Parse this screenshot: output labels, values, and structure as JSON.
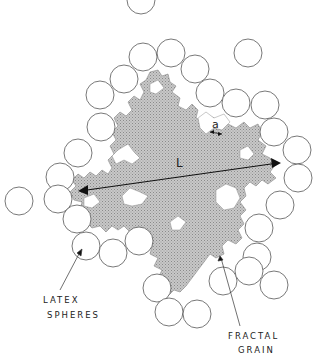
{
  "figure": {
    "labels": {
      "latex_spheres_line1": "LATEX",
      "latex_spheres_line2": "SPHERES",
      "fractal_grain_line1": "FRACTAL",
      "fractal_grain_line2": "GRAIN",
      "length_symbol": "L",
      "radius_symbol": "a"
    },
    "colors": {
      "grain_fill": "#bdbdbd",
      "sphere_stroke": "#555555",
      "background": "#ffffff",
      "ink": "#222222"
    },
    "sphere_radius_px": 14,
    "spheres": [
      {
        "cx": 141,
        "cy": 0
      },
      {
        "cx": 248,
        "cy": 53
      },
      {
        "cx": 143,
        "cy": 57
      },
      {
        "cx": 171,
        "cy": 53
      },
      {
        "cx": 195,
        "cy": 69
      },
      {
        "cx": 124,
        "cy": 79
      },
      {
        "cx": 100,
        "cy": 95
      },
      {
        "cx": 210,
        "cy": 93
      },
      {
        "cx": 236,
        "cy": 103
      },
      {
        "cx": 265,
        "cy": 105
      },
      {
        "cx": 101,
        "cy": 127
      },
      {
        "cx": 274,
        "cy": 132
      },
      {
        "cx": 78,
        "cy": 153
      },
      {
        "cx": 297,
        "cy": 150
      },
      {
        "cx": 60,
        "cy": 177
      },
      {
        "cx": 298,
        "cy": 178
      },
      {
        "cx": 19,
        "cy": 201
      },
      {
        "cx": 58,
        "cy": 199
      },
      {
        "cx": 280,
        "cy": 205
      },
      {
        "cx": 77,
        "cy": 219
      },
      {
        "cx": 259,
        "cy": 228
      },
      {
        "cx": 86,
        "cy": 246
      },
      {
        "cx": 113,
        "cy": 253
      },
      {
        "cx": 139,
        "cy": 241
      },
      {
        "cx": 257,
        "cy": 257
      },
      {
        "cx": 157,
        "cy": 288
      },
      {
        "cx": 223,
        "cy": 281
      },
      {
        "cx": 249,
        "cy": 271
      },
      {
        "cx": 274,
        "cy": 285
      },
      {
        "cx": 169,
        "cy": 312
      },
      {
        "cx": 197,
        "cy": 314
      }
    ]
  }
}
